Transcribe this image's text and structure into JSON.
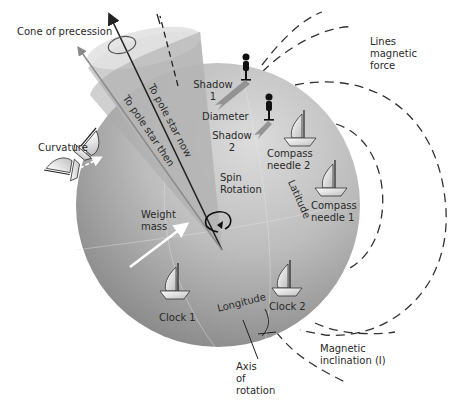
{
  "diagram": {
    "title_labels": {
      "cone_of_precession": "Cone of precession",
      "lines_magnetic_force": [
        "Lines",
        "magnetic",
        "force"
      ],
      "to_pole_star_now": "To pole star now",
      "to_pole_star_then": "To pole star then",
      "shadow_1": [
        "Shadow",
        "1"
      ],
      "diameter": "Diameter",
      "shadow_2": [
        "Shadow",
        "2"
      ],
      "compass_needle_2": [
        "Compass",
        "needle 2"
      ],
      "compass_needle_1": [
        "Compass",
        "needle 1"
      ],
      "curvature": "Curvature",
      "spin_rotation": [
        "Spin",
        "Rotation"
      ],
      "latitude": "Latitude",
      "weight_mass": [
        "Weight",
        "mass"
      ],
      "clock_1": "Clock 1",
      "clock_2": "Clock 2",
      "longitude": "Longitude",
      "axis_of_rotation": [
        "Axis",
        "of",
        "rotation"
      ],
      "magnetic_inclination": [
        "Magnetic",
        "inclination (I)"
      ]
    },
    "icons": [
      "sailboat-icon",
      "person-icon",
      "spin-arrow-icon",
      "white-arrow-icon",
      "precession-ellipse-icon"
    ],
    "colors": {
      "sphere_light": "#d4d4d4",
      "sphere_dark": "#8a8a8a",
      "cone_light": "#cfcfcf",
      "cone_dark": "#9a9a9a",
      "text": "#2a2a2a",
      "dash": "#333333"
    }
  }
}
